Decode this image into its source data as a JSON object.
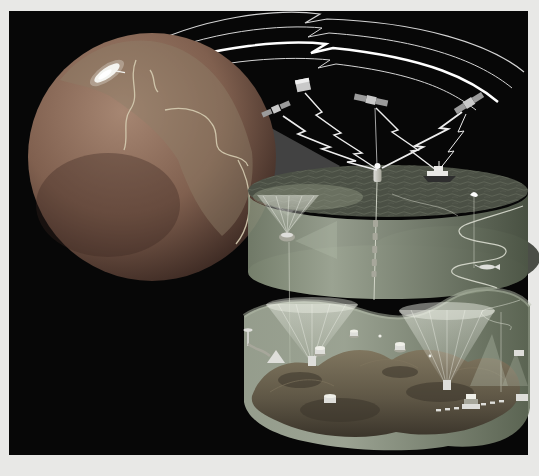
{
  "scene": {
    "type": "ocean-observing-system-illustration",
    "satellite_count": 4,
    "telemetry_arc_count": 4,
    "component_names": [
      "earth-globe",
      "ground-station-dish",
      "telemetry-arcs",
      "communication-satellites",
      "lightning-telemetry-links",
      "magnifier-beam",
      "ocean-surface-disc",
      "research-vessel",
      "surface-mooring-buoy",
      "drifter-buoy",
      "instrumented-mooring-line",
      "subsurface-float",
      "upward-sonar-beam",
      "horizontal-sonar-beam",
      "glider-yoyo-track",
      "auv",
      "seafloor-disc",
      "seafloor-terrain",
      "seafloor-sonar-beams",
      "seafloor-instruments",
      "seafloor-cable-nodes"
    ]
  },
  "colors": {
    "page_bg": "#e8e8e6",
    "frame_black": "#070707",
    "globe_hi": "#a68672",
    "globe_mid": "#80604f",
    "globe_edge": "#382620",
    "globe_land": "#8f7f68",
    "globe_coast": "#d6cdb2",
    "dish_white": "#f4f4f0",
    "arc_line": "#d4d4d4",
    "arc_bright": "#ffffff",
    "satellite_body": "#c9c9c9",
    "satellite_panel": "#9b9b9b",
    "bolt": "#ededed",
    "wedge_gray": "#4c4c4c",
    "beam_white": "#ffffff",
    "sea_surface": "#4b5045",
    "sea_wave": "#696e60",
    "sea_glow": "#99a089",
    "wall_light": "#b5beab",
    "wall_mid": "#87927c",
    "wall_dark": "#57614f",
    "sea_bottom_dark": "#23271f",
    "floor_wall_light": "#aeb7a4",
    "floor_wall_dark": "#69745f",
    "seafloor_light": "#80765f",
    "seafloor_mid": "#5f5746",
    "seafloor_dark": "#3b352b",
    "cone_white": "#f2f4ec",
    "instrument": "#dededa",
    "instrument_dark": "#a7a79b",
    "track_line": "#d9dccf",
    "ship_hull": "#2e2e2e",
    "ship_top": "#e9e9e6"
  }
}
